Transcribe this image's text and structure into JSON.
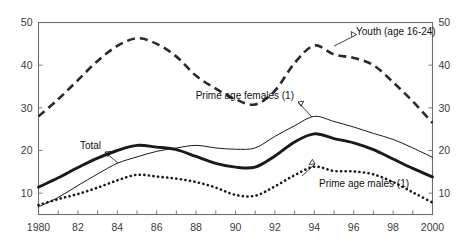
{
  "chart_data": {
    "type": "line",
    "title": "",
    "subtitle": "",
    "xlabel": "",
    "ylabel": "",
    "xlim": [
      1980,
      2000
    ],
    "ylim": [
      5,
      50
    ],
    "y_ticks": [
      10,
      20,
      30,
      40,
      50
    ],
    "y_axis_left_labels": [
      "10",
      "20",
      "30",
      "40",
      "50"
    ],
    "y_axis_right_labels": [
      "10",
      "20",
      "30",
      "40",
      "50"
    ],
    "x": [
      1980,
      1981,
      1982,
      1983,
      1984,
      1985,
      1986,
      1987,
      1988,
      1989,
      1990,
      1991,
      1992,
      1993,
      1994,
      1995,
      1996,
      1997,
      1998,
      1999,
      2000
    ],
    "x_tick_labels": [
      "1980",
      "",
      "82",
      "",
      "84",
      "",
      "86",
      "",
      "88",
      "",
      "90",
      "",
      "92",
      "",
      "94",
      "",
      "96",
      "",
      "98",
      "",
      "2000"
    ],
    "x_minor_ticks_every": 1,
    "grid": false,
    "legend": "none (inline annotations with leader arrows)",
    "series": [
      {
        "name": "Youth (age 16-24)",
        "style": "dashed",
        "values": [
          28.0,
          32.0,
          36.5,
          41.0,
          44.5,
          46.3,
          45.0,
          42.0,
          37.5,
          34.5,
          32.0,
          30.8,
          34.0,
          40.5,
          44.6,
          42.5,
          41.7,
          40.0,
          36.0,
          31.5,
          26.5
        ]
      },
      {
        "name": "Prime age females (1)",
        "style": "thin-solid",
        "values": [
          6.8,
          9.0,
          11.8,
          14.5,
          17.0,
          18.5,
          19.8,
          20.6,
          21.2,
          20.6,
          20.3,
          20.6,
          23.3,
          25.8,
          28.0,
          26.8,
          25.5,
          24.0,
          22.6,
          20.6,
          18.4
        ]
      },
      {
        "name": "Total",
        "style": "thick-solid",
        "values": [
          11.4,
          13.6,
          16.0,
          18.2,
          20.0,
          21.2,
          20.8,
          20.2,
          18.6,
          17.0,
          16.1,
          16.1,
          18.7,
          22.0,
          23.9,
          22.8,
          21.8,
          20.2,
          18.0,
          15.8,
          13.8
        ]
      },
      {
        "name": "Prime age males (1)",
        "style": "dotted",
        "values": [
          7.2,
          8.6,
          9.8,
          11.3,
          13.0,
          14.3,
          13.9,
          13.4,
          12.6,
          11.3,
          9.6,
          9.4,
          11.6,
          14.2,
          16.2,
          15.2,
          15.1,
          14.4,
          12.6,
          10.2,
          7.8
        ]
      }
    ],
    "annotations": [
      {
        "text": "Youth (age 16-24)",
        "points_to_series": "Youth (age 16-24)"
      },
      {
        "text": "Prime age females (1)",
        "points_to_series": "Prime age females (1)"
      },
      {
        "text": "Total",
        "points_to_series": "Total"
      },
      {
        "text": "Prime age males (1)",
        "points_to_series": "Prime age males (1)"
      }
    ],
    "colors": {
      "line": "#1a1a1a",
      "axis": "#6e6e6e",
      "text": "#333333",
      "background": "#ffffff"
    }
  }
}
